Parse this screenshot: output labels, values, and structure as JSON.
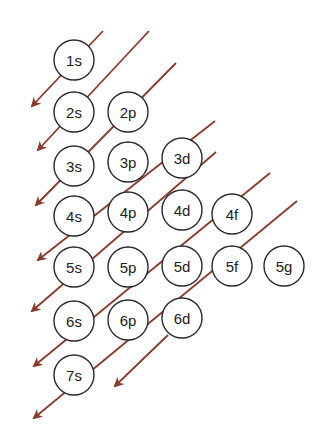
{
  "diagram": {
    "arrow_color": "#8b3a2a",
    "circle_stroke": "#2a2a2a",
    "circle_radius": 20,
    "orbitals": [
      {
        "label": "1s",
        "cx": 74,
        "cy": 60
      },
      {
        "label": "2s",
        "cx": 74,
        "cy": 112
      },
      {
        "label": "2p",
        "cx": 128,
        "cy": 112
      },
      {
        "label": "3s",
        "cx": 74,
        "cy": 166
      },
      {
        "label": "3p",
        "cx": 128,
        "cy": 162
      },
      {
        "label": "3d",
        "cx": 182,
        "cy": 158
      },
      {
        "label": "4s",
        "cx": 74,
        "cy": 216
      },
      {
        "label": "4p",
        "cx": 128,
        "cy": 212
      },
      {
        "label": "4d",
        "cx": 182,
        "cy": 210
      },
      {
        "label": "4f",
        "cx": 232,
        "cy": 214
      },
      {
        "label": "5s",
        "cx": 74,
        "cy": 267
      },
      {
        "label": "5p",
        "cx": 128,
        "cy": 267
      },
      {
        "label": "5d",
        "cx": 182,
        "cy": 266
      },
      {
        "label": "5f",
        "cx": 232,
        "cy": 266
      },
      {
        "label": "5g",
        "cx": 284,
        "cy": 266
      },
      {
        "label": "6s",
        "cx": 74,
        "cy": 321
      },
      {
        "label": "6p",
        "cx": 128,
        "cy": 320
      },
      {
        "label": "6d",
        "cx": 182,
        "cy": 318
      },
      {
        "label": "7s",
        "cx": 74,
        "cy": 375
      }
    ],
    "arrows": [
      {
        "x1": 103,
        "y1": 31,
        "x2": 32,
        "y2": 106
      },
      {
        "x1": 149,
        "y1": 31,
        "x2": 38,
        "y2": 150
      },
      {
        "x1": 176,
        "y1": 63,
        "x2": 36,
        "y2": 205
      },
      {
        "x1": 215,
        "y1": 121,
        "x2": 38,
        "y2": 260
      },
      {
        "x1": 216,
        "y1": 152,
        "x2": 32,
        "y2": 311
      },
      {
        "x1": 270,
        "y1": 173,
        "x2": 34,
        "y2": 366
      },
      {
        "x1": 297,
        "y1": 201,
        "x2": 34,
        "y2": 418
      },
      {
        "x1": 168,
        "y1": 335,
        "x2": 115,
        "y2": 386
      }
    ]
  }
}
